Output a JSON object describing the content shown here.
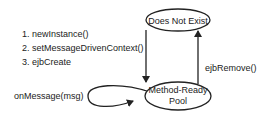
{
  "diagram": {
    "type": "state-diagram",
    "states": [
      {
        "id": "does-not-exist",
        "label_lines": [
          "Does Not Exist"
        ]
      },
      {
        "id": "method-ready-pool",
        "label_lines": [
          "Method-Ready",
          "Pool"
        ]
      }
    ],
    "transitions": [
      {
        "from": "does-not-exist",
        "to": "method-ready-pool",
        "label_lines": [
          "1. newInstance()",
          "2. setMessageDrivenContext()",
          "3. ejbCreate"
        ]
      },
      {
        "from": "method-ready-pool",
        "to": "does-not-exist",
        "label_lines": [
          "ejbRemove()"
        ]
      },
      {
        "from": "method-ready-pool",
        "to": "method-ready-pool",
        "label_lines": [
          "onMessage(msg)"
        ]
      }
    ]
  }
}
